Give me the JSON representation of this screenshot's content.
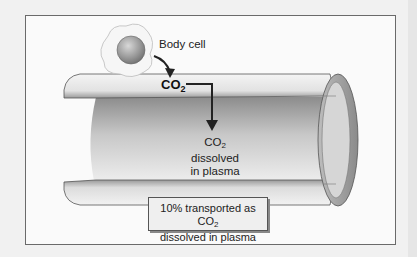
{
  "figure": {
    "labels": {
      "body_cell": "Body cell",
      "co2_main": "CO",
      "co2_main_sub": "2",
      "dissolved_line1_prefix": "CO",
      "dissolved_line1_sub": "2",
      "dissolved_line1_suffix": " dissolved",
      "dissolved_line2": "in plasma"
    },
    "callout": {
      "line1_prefix": "10% transported as CO",
      "line1_sub": "2",
      "line2": "dissolved in plasma"
    },
    "colors": {
      "frame_border": "#6a6a6a",
      "background": "#fafafa",
      "vessel_light": "#f2f2f2",
      "vessel_dark": "#8a8a8a",
      "arrow": "#222222"
    }
  }
}
